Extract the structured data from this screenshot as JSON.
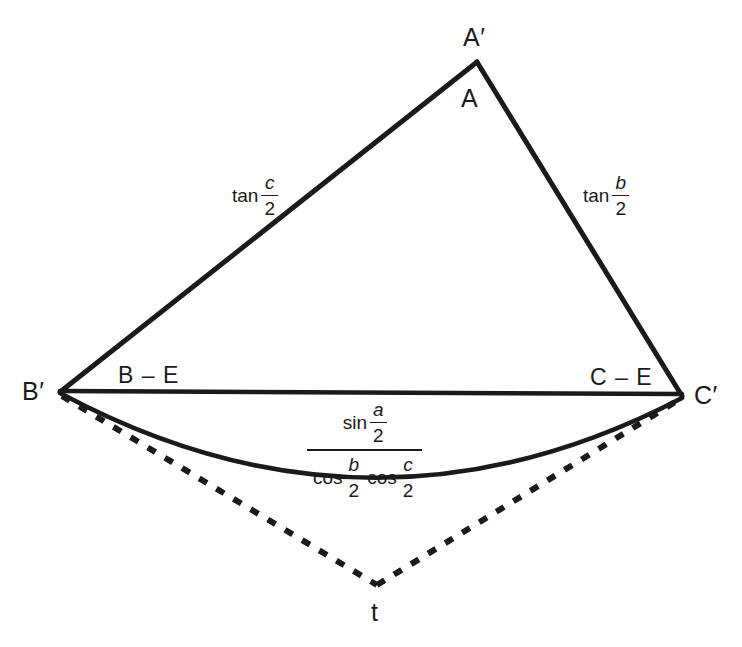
{
  "figure": {
    "stroke_color": "#1a1a1a",
    "background_color": "#ffffff",
    "vertices": {
      "a_prime": {
        "label": "A′",
        "x": 477,
        "y": 62
      },
      "a": {
        "label": "A",
        "x": 470,
        "y": 98
      },
      "b_prime": {
        "label": "B′",
        "x": 60,
        "y": 392
      },
      "c_prime": {
        "label": "C′",
        "x": 682,
        "y": 396
      },
      "t": {
        "label": "t",
        "x": 377,
        "y": 585
      }
    },
    "side_labels": {
      "left_b_minus_e": "B – E",
      "right_c_minus_e": "C – E"
    },
    "edge_labels": {
      "left_edge": {
        "fn": "tan",
        "numerator": "c",
        "denominator": "2"
      },
      "right_edge": {
        "fn": "tan",
        "numerator": "b",
        "denominator": "2"
      }
    },
    "arc_label": {
      "numerator": {
        "fn": "sin",
        "num": "a",
        "den": "2"
      },
      "denominator": [
        {
          "fn": "cos",
          "num": "b",
          "den": "2"
        },
        {
          "fn": "cos",
          "num": "c",
          "den": "2"
        }
      ]
    },
    "geometry": {
      "solid_edges": [
        {
          "name": "left-edge-b-to-a",
          "from": [
            60,
            392
          ],
          "to": [
            477,
            62
          ]
        },
        {
          "name": "right-edge-a-to-c",
          "from": [
            477,
            62
          ],
          "to": [
            682,
            396
          ]
        },
        {
          "name": "base-b-to-c",
          "from": [
            60,
            391
          ],
          "to": [
            682,
            394
          ]
        }
      ],
      "solid_arc": {
        "name": "bulge-arc-b-to-c",
        "from": [
          60,
          393
        ],
        "control": [
          371,
          560
        ],
        "to": [
          682,
          398
        ]
      },
      "dashed_edges": [
        {
          "name": "dashed-b-to-t",
          "from": [
            62,
            396
          ],
          "to": [
            377,
            585
          ]
        },
        {
          "name": "dashed-t-to-c",
          "from": [
            377,
            585
          ],
          "to": [
            680,
            399
          ]
        }
      ]
    }
  }
}
